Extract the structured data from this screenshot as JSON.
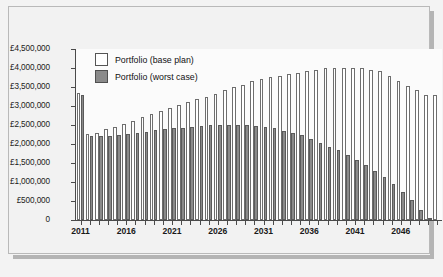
{
  "chart_data": {
    "type": "bar",
    "title": "",
    "subtitle": "",
    "xlabel": "",
    "ylabel": "",
    "currency": "GBP",
    "grid": false,
    "legend_position": "top-left",
    "ylim": [
      0,
      4500000
    ],
    "ytick_labels": [
      "£4,500,000",
      "£4,000,000",
      "£3,500,000",
      "£3,000,000",
      "£2,500,000",
      "£2,000,000",
      "£1,500,000",
      "£1,000,000",
      "£500,000",
      "0"
    ],
    "ytick_values": [
      4500000,
      4000000,
      3500000,
      3000000,
      2500000,
      2000000,
      1500000,
      1000000,
      500000,
      0
    ],
    "xtick_labels": [
      "2011",
      "2016",
      "2021",
      "2026",
      "2031",
      "2036",
      "2041",
      "2046"
    ],
    "xtick_values": [
      2011,
      2016,
      2021,
      2026,
      2031,
      2036,
      2041,
      2046
    ],
    "categories": [
      2011,
      2012,
      2013,
      2014,
      2015,
      2016,
      2017,
      2018,
      2019,
      2020,
      2021,
      2022,
      2023,
      2024,
      2025,
      2026,
      2027,
      2028,
      2029,
      2030,
      2031,
      2032,
      2033,
      2034,
      2035,
      2036,
      2037,
      2038,
      2039,
      2040,
      2041,
      2042,
      2043,
      2044,
      2045,
      2046,
      2047,
      2048,
      2049,
      2050
    ],
    "series": [
      {
        "name": "Portfolio (base plan)",
        "color": "#ffffff",
        "edge_color": "#6e6e6e",
        "values": [
          3350000,
          2270000,
          2300000,
          2400000,
          2450000,
          2520000,
          2600000,
          2700000,
          2800000,
          2880000,
          2950000,
          3020000,
          3100000,
          3180000,
          3250000,
          3320000,
          3430000,
          3500000,
          3560000,
          3650000,
          3700000,
          3760000,
          3800000,
          3830000,
          3880000,
          3920000,
          3950000,
          3990000,
          4000000,
          4010000,
          4000000,
          3990000,
          3950000,
          3910000,
          3800000,
          3650000,
          3530000,
          3420000,
          3300000,
          3280000
        ]
      },
      {
        "name": "Portfolio (worst case)",
        "color": "#8a8a8a",
        "edge_color": "#5a5a5a",
        "values": [
          3290000,
          2220000,
          2200000,
          2210000,
          2250000,
          2270000,
          2290000,
          2320000,
          2370000,
          2390000,
          2410000,
          2430000,
          2460000,
          2480000,
          2500000,
          2500000,
          2510000,
          2510000,
          2490000,
          2470000,
          2440000,
          2410000,
          2350000,
          2300000,
          2240000,
          2140000,
          2030000,
          1930000,
          1830000,
          1700000,
          1580000,
          1450000,
          1300000,
          1140000,
          960000,
          730000,
          520000,
          260000,
          40000,
          0
        ]
      }
    ]
  },
  "legend": {
    "items": [
      {
        "label": "Portfolio (base plan)"
      },
      {
        "label": "Portfolio (worst case)"
      }
    ]
  }
}
